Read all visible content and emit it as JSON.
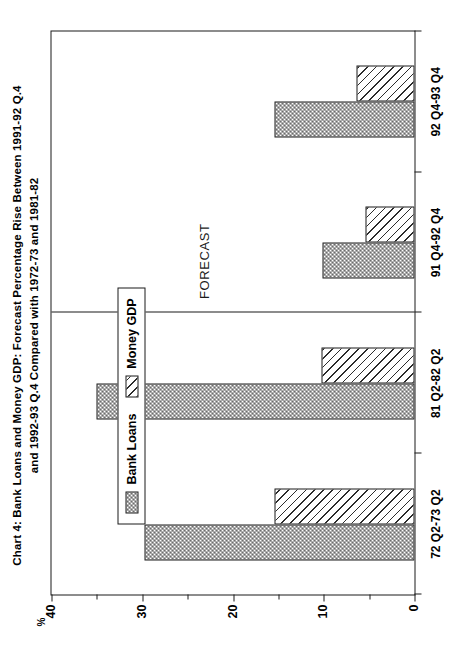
{
  "figure": {
    "title_line1": "Chart 4:   Bank Loans and Money GDP: Forecast Percentage Rise Between 1991-92 Q.4",
    "title_line2": "and 1992-93 Q.4 Compared with 1972-73 and 1981-82",
    "forecast_label": "FORECAST",
    "percent_symbol": "%"
  },
  "legend": {
    "items": [
      {
        "label": "Bank Loans",
        "pattern": "checkerboard",
        "color": "#4a4a4a"
      },
      {
        "label": "Money GDP",
        "pattern": "diagonal-hatch",
        "color": "#2b2b2b"
      }
    ]
  },
  "axis": {
    "value_major_ticks": [
      "0",
      "10",
      "20",
      "30",
      "40"
    ],
    "value_minor_ticks": [
      "5",
      "15",
      "25",
      "35"
    ],
    "value_min": 0,
    "value_max": 40
  },
  "chart_data": {
    "type": "bar",
    "title": "Chart 4:   Bank Loans and Money GDP: Forecast Percentage Rise Between 1991-92 Q.4 and 1992-93 Q.4 Compared with 1972-73 and 1981-82",
    "xlabel": "",
    "ylabel": "%",
    "ylim": [
      0,
      40
    ],
    "yticks": [
      0,
      5,
      10,
      15,
      20,
      25,
      30,
      35,
      40
    ],
    "ytick_labels": [
      "0",
      "",
      "10",
      "",
      "20",
      "",
      "30",
      "",
      "40"
    ],
    "grid": false,
    "legend_position": "upper-left",
    "orientation": "vertical-bars-page-rotated-90",
    "categories": [
      "72 Q2-73 Q2",
      "81 Q2-82 Q2",
      "91 Q4-92 Q4",
      "92 Q4-93 Q4"
    ],
    "series": [
      {
        "name": "Bank Loans",
        "values": [
          29.8,
          35.0,
          10.1,
          15.4
        ]
      },
      {
        "name": "Money GDP",
        "values": [
          15.4,
          10.2,
          5.4,
          6.4
        ]
      }
    ],
    "annotations": [
      {
        "text": "FORECAST",
        "kind": "vertical-divider-with-label",
        "between_categories": [
          "81 Q2-82 Q2",
          "91 Q4-92 Q4"
        ]
      }
    ]
  }
}
